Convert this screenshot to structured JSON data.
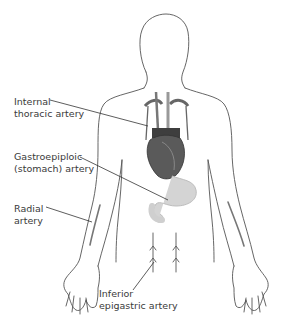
{
  "figure": {
    "type": "anatomical-diagram",
    "labels": [
      {
        "id": "internal-thoracic",
        "line1": "Internal",
        "line2": "thoracic artery"
      },
      {
        "id": "gastroepiploic",
        "line1": "Gastroepiploic",
        "line2": "(stomach) artery"
      },
      {
        "id": "radial",
        "line1": "Radial",
        "line2": "artery"
      },
      {
        "id": "inferior-epigastric",
        "line1": "Inferior",
        "line2": "epigastric artery"
      }
    ],
    "colors": {
      "outline": "#555555",
      "heart": "#5a5a5a",
      "stomach": "#cfcfcf",
      "text": "#3a3a3a"
    }
  }
}
